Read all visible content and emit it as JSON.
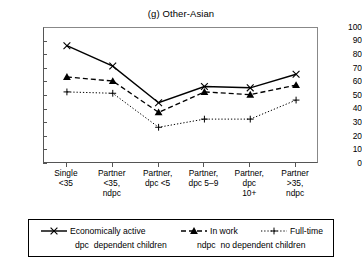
{
  "chart_data": {
    "type": "line",
    "title": "(g) Other-Asian",
    "xlabel": "",
    "ylabel": "",
    "ylim": [
      0,
      100
    ],
    "yticks": [
      0,
      10,
      20,
      30,
      40,
      50,
      60,
      70,
      80,
      90,
      100
    ],
    "grid": false,
    "legend_position": "bottom",
    "categories": [
      "Single\n<35",
      "Partner\n<35,\nndpc",
      "Partner,\ndpc <5",
      "Partner,\ndpc 5–9",
      "Partner,\ndpc\n10+",
      "Partner\n>35,\nndpc"
    ],
    "series": [
      {
        "name": "Economically active",
        "marker": "x",
        "line": "solid",
        "values": [
          87,
          72,
          45,
          57,
          56,
          66
        ]
      },
      {
        "name": "In work",
        "marker": "triangle",
        "line": "dashed",
        "values": [
          64,
          61,
          38,
          53,
          51,
          58
        ]
      },
      {
        "name": "Full-time",
        "marker": "plus",
        "line": "dotted",
        "values": [
          53,
          52,
          27,
          33,
          33,
          47
        ]
      }
    ],
    "annotations": [
      {
        "term": "dpc",
        "definition": "dependent children"
      },
      {
        "term": "ndpc",
        "definition": "no dependent children"
      }
    ]
  },
  "legend": {
    "items": [
      {
        "label": "Economically active"
      },
      {
        "label": "In work"
      },
      {
        "label": "Full-time"
      }
    ],
    "abbrev": [
      {
        "term": "dpc",
        "text": "dependent children"
      },
      {
        "term": "ndpc",
        "text": "no dependent children"
      }
    ]
  },
  "colors": {
    "line": "#000000",
    "axis": "#555555",
    "background": "#ffffff"
  }
}
